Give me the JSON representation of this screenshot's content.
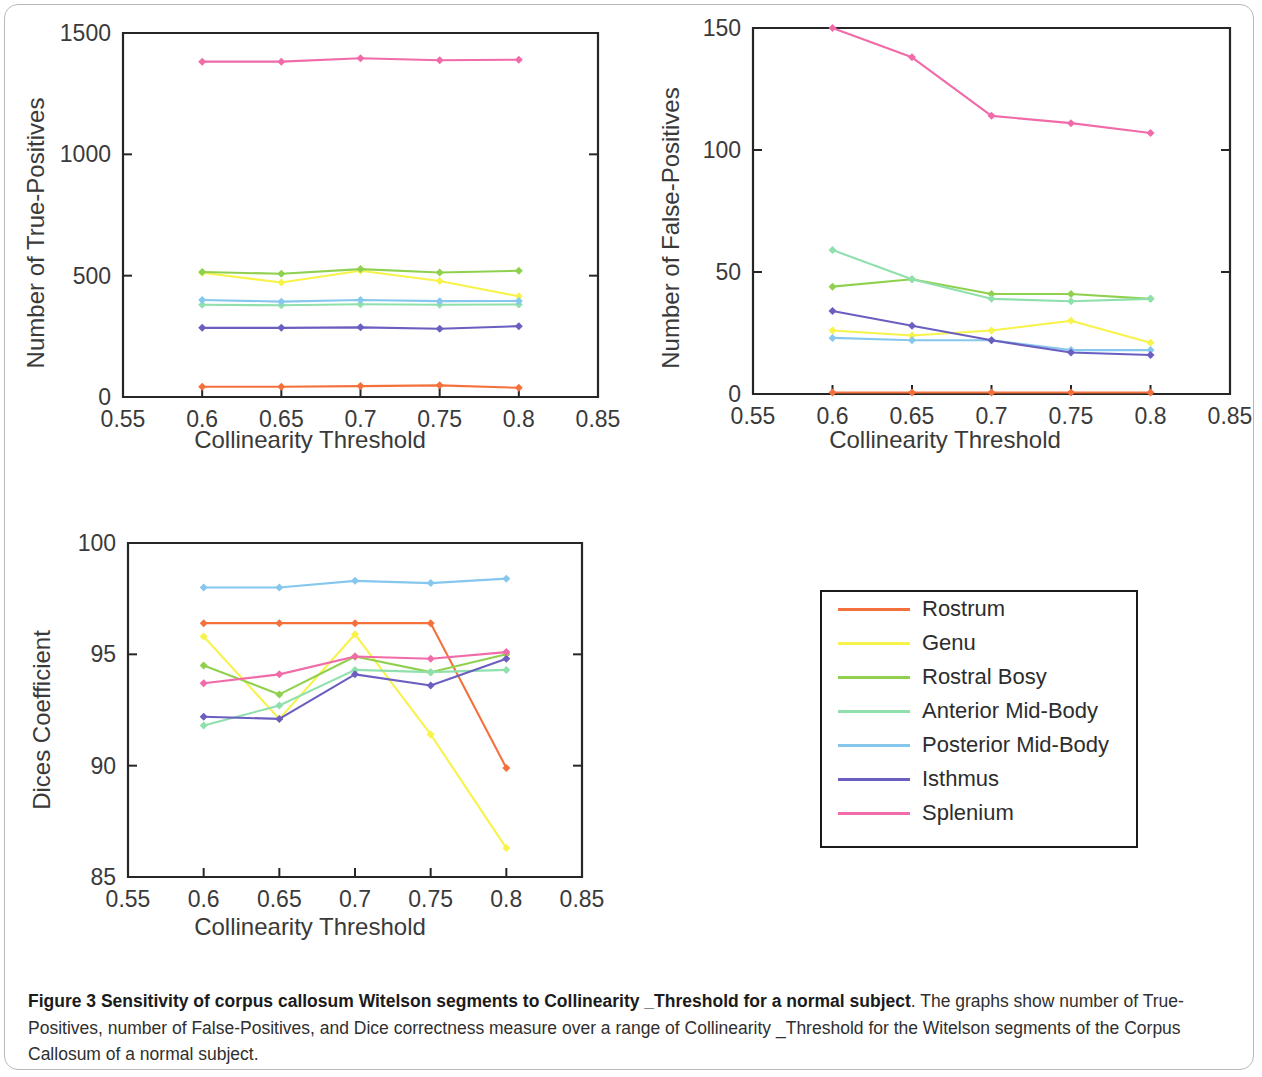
{
  "figure": {
    "caption_bold": "Figure 3 Sensitivity of corpus callosum Witelson segments to Collinearity _Threshold for a normal subject",
    "caption_rest": ". The graphs show number of True-Positives, number of False-Positives, and Dice correctness measure over a range of Collinearity _Threshold for the Witelson segments of the Corpus Callosum of a normal subject."
  },
  "legend": {
    "title": "",
    "items": [
      {
        "label": "Rostrum",
        "color": "#f4713c"
      },
      {
        "label": "Genu",
        "color": "#f7f34a"
      },
      {
        "label": "Rostral Bosy",
        "color": "#8fd14f"
      },
      {
        "label": "Anterior Mid-Body",
        "color": "#8fe0ad"
      },
      {
        "label": "Posterior Mid-Body",
        "color": "#86c7ee"
      },
      {
        "label": "Isthmus",
        "color": "#6a5fc0"
      },
      {
        "label": "Splenium",
        "color": "#f06ba8"
      }
    ]
  },
  "chart_data": [
    {
      "id": "true-positives",
      "type": "line",
      "title": "",
      "xlabel": "Collinearity Threshold",
      "ylabel": "Number of True-Positives",
      "x": [
        0.6,
        0.65,
        0.7,
        0.75,
        0.8
      ],
      "xlim": [
        0.55,
        0.85
      ],
      "ylim": [
        0,
        1500
      ],
      "xticks": [
        0.55,
        0.6,
        0.65,
        0.7,
        0.75,
        0.8,
        0.85
      ],
      "xticklabels": [
        "0.55",
        "0.6",
        "0.65",
        "0.7",
        "0.75",
        "0.8",
        "0.85"
      ],
      "yticks": [
        0,
        500,
        1000,
        1500
      ],
      "yticklabels": [
        "0",
        "500",
        "1000",
        "1500"
      ],
      "grid": false,
      "legend_position": "external",
      "series": [
        {
          "name": "Rostrum",
          "color": "#f4713c",
          "values": [
            42,
            42,
            45,
            48,
            38
          ]
        },
        {
          "name": "Genu",
          "color": "#f7f34a",
          "values": [
            512,
            472,
            520,
            478,
            415
          ]
        },
        {
          "name": "Rostral Bosy",
          "color": "#8fd14f",
          "values": [
            515,
            508,
            527,
            513,
            520
          ]
        },
        {
          "name": "Anterior Mid-Body",
          "color": "#8fe0ad",
          "values": [
            380,
            378,
            382,
            380,
            381
          ]
        },
        {
          "name": "Posterior Mid-Body",
          "color": "#86c7ee",
          "values": [
            400,
            393,
            400,
            395,
            396
          ]
        },
        {
          "name": "Isthmus",
          "color": "#6a5fc0",
          "values": [
            285,
            285,
            287,
            281,
            292
          ]
        },
        {
          "name": "Splenium",
          "color": "#f06ba8",
          "values": [
            1382,
            1382,
            1396,
            1388,
            1390
          ]
        }
      ]
    },
    {
      "id": "false-positives",
      "type": "line",
      "title": "",
      "xlabel": "Collinearity Threshold",
      "ylabel": "Number of False-Positives",
      "x": [
        0.6,
        0.65,
        0.7,
        0.75,
        0.8
      ],
      "xlim": [
        0.55,
        0.85
      ],
      "ylim": [
        0,
        150
      ],
      "xticks": [
        0.55,
        0.6,
        0.65,
        0.7,
        0.75,
        0.8,
        0.85
      ],
      "xticklabels": [
        "0.55",
        "0.6",
        "0.65",
        "0.7",
        "0.75",
        "0.8",
        "0.85"
      ],
      "yticks": [
        0,
        50,
        100,
        150
      ],
      "yticklabels": [
        "0",
        "50",
        "100",
        "150"
      ],
      "grid": false,
      "legend_position": "external",
      "series": [
        {
          "name": "Rostrum",
          "color": "#f4713c",
          "values": [
            0.6,
            0.6,
            0.6,
            0.6,
            0.6
          ]
        },
        {
          "name": "Genu",
          "color": "#f7f34a",
          "values": [
            26,
            24,
            26,
            30,
            21
          ]
        },
        {
          "name": "Rostral Bosy",
          "color": "#8fd14f",
          "values": [
            44,
            47,
            41,
            41,
            39
          ]
        },
        {
          "name": "Anterior Mid-Body",
          "color": "#8fe0ad",
          "values": [
            59,
            47,
            39,
            38,
            39
          ]
        },
        {
          "name": "Posterior Mid-Body",
          "color": "#86c7ee",
          "values": [
            23,
            22,
            22,
            18,
            18
          ]
        },
        {
          "name": "Isthmus",
          "color": "#6a5fc0",
          "values": [
            34,
            28,
            22,
            17,
            16
          ]
        },
        {
          "name": "Splenium",
          "color": "#f06ba8",
          "values": [
            150,
            138,
            114,
            111,
            107
          ]
        }
      ]
    },
    {
      "id": "dices-coefficient",
      "type": "line",
      "title": "",
      "xlabel": "Collinearity Threshold",
      "ylabel": "Dices Coefficient",
      "x": [
        0.6,
        0.65,
        0.7,
        0.75,
        0.8
      ],
      "xlim": [
        0.55,
        0.85
      ],
      "ylim": [
        85,
        100
      ],
      "xticks": [
        0.55,
        0.6,
        0.65,
        0.7,
        0.75,
        0.8,
        0.85
      ],
      "xticklabels": [
        "0.55",
        "0.6",
        "0.65",
        "0.7",
        "0.75",
        "0.8",
        "0.85"
      ],
      "yticks": [
        85,
        90,
        95,
        100
      ],
      "yticklabels": [
        "85",
        "90",
        "95",
        "100"
      ],
      "grid": false,
      "legend_position": "external",
      "series": [
        {
          "name": "Rostrum",
          "color": "#f4713c",
          "values": [
            96.4,
            96.4,
            96.4,
            96.4,
            89.9
          ]
        },
        {
          "name": "Genu",
          "color": "#f7f34a",
          "values": [
            95.8,
            92.1,
            95.9,
            91.4,
            86.3
          ]
        },
        {
          "name": "Rostral Bosy",
          "color": "#8fd14f",
          "values": [
            94.5,
            93.2,
            94.9,
            94.2,
            95.0
          ]
        },
        {
          "name": "Anterior Mid-Body",
          "color": "#8fe0ad",
          "values": [
            91.8,
            92.7,
            94.3,
            94.2,
            94.3
          ]
        },
        {
          "name": "Posterior Mid-Body",
          "color": "#86c7ee",
          "values": [
            98.0,
            98.0,
            98.3,
            98.2,
            98.4
          ]
        },
        {
          "name": "Isthmus",
          "color": "#6a5fc0",
          "values": [
            92.2,
            92.1,
            94.1,
            93.6,
            94.8
          ]
        },
        {
          "name": "Splenium",
          "color": "#f06ba8",
          "values": [
            93.7,
            94.1,
            94.9,
            94.8,
            95.1
          ]
        }
      ]
    }
  ]
}
